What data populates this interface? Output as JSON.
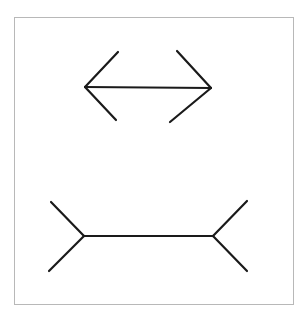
{
  "diagram": {
    "title": "",
    "frame": {
      "x": 14,
      "y": 17,
      "width": 279,
      "height": 287,
      "border_color": "#b8b8b8"
    },
    "stroke_color": "#1a1a1a",
    "stroke_width": 2.2,
    "figures": [
      {
        "name": "arrowheads-inward-figure",
        "shaft": {
          "x1": 85,
          "y1": 87,
          "x2": 211,
          "y2": 88
        },
        "fins": [
          {
            "x1": 85,
            "y1": 87,
            "x2": 118,
            "y2": 52
          },
          {
            "x1": 85,
            "y1": 87,
            "x2": 116,
            "y2": 120
          },
          {
            "x1": 211,
            "y1": 88,
            "x2": 177,
            "y2": 51
          },
          {
            "x1": 211,
            "y1": 88,
            "x2": 170,
            "y2": 122
          }
        ]
      },
      {
        "name": "arrowheads-outward-figure",
        "shaft": {
          "x1": 84,
          "y1": 236,
          "x2": 213,
          "y2": 236
        },
        "fins": [
          {
            "x1": 84,
            "y1": 236,
            "x2": 51,
            "y2": 202
          },
          {
            "x1": 84,
            "y1": 236,
            "x2": 49,
            "y2": 271
          },
          {
            "x1": 213,
            "y1": 236,
            "x2": 247,
            "y2": 201
          },
          {
            "x1": 213,
            "y1": 236,
            "x2": 247,
            "y2": 271
          }
        ]
      }
    ]
  }
}
